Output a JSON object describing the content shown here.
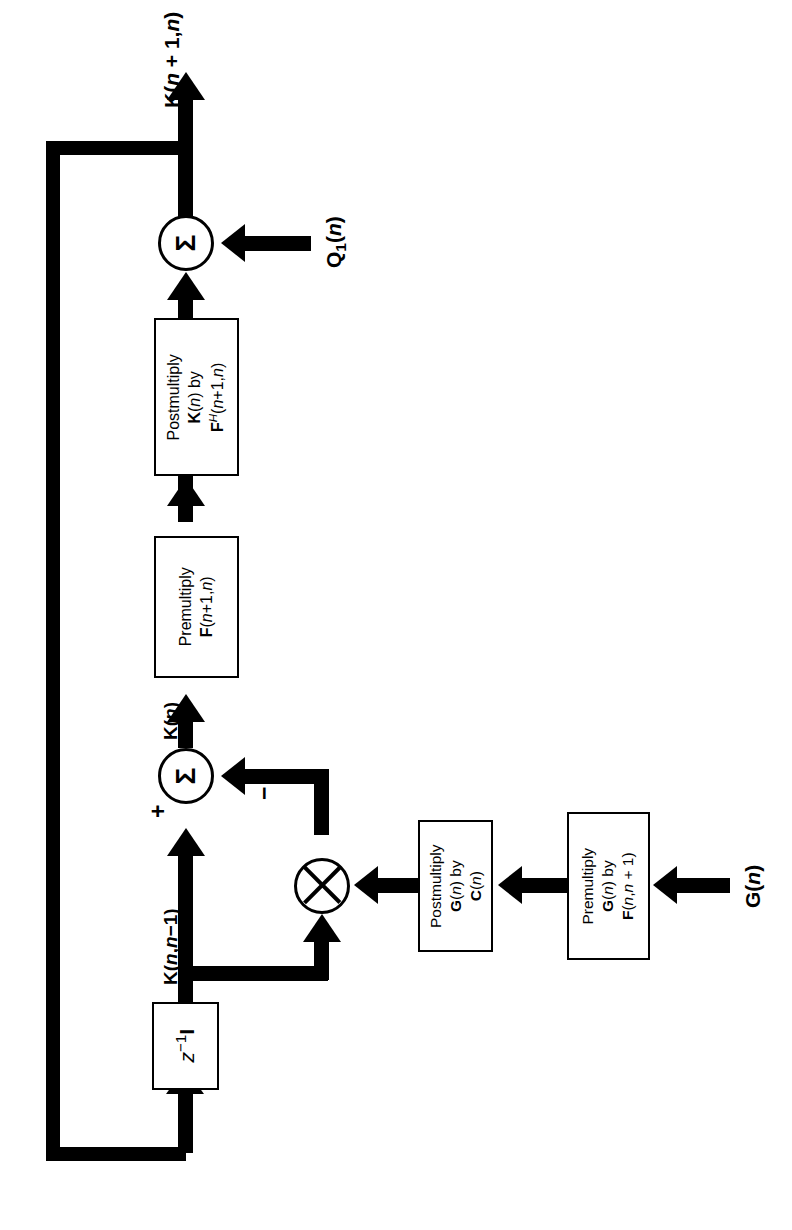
{
  "figure": {
    "kind": "signal-flow block diagram",
    "orientation": "rotated 90 degrees counter-clockwise on the page",
    "title": ""
  },
  "blocks": {
    "postmultiply_k": {
      "name": "postmultiply-k-block",
      "line1": "Postmultiply",
      "line2_html": "<b>K</b>(<i>n</i>) by",
      "line3_html": "<b>F</b><span class=\"sup\">H</span>(<i>n</i>+1,<i>n</i>)"
    },
    "premultiply_f": {
      "name": "premultiply-f-block",
      "line1": "Premultiply",
      "line2_html": "<b>F</b>(<i>n</i>+1,<i>n</i>)"
    },
    "postmultiply_g": {
      "name": "postmultiply-g-block",
      "line1": "Postmultiply",
      "line2_html": "<b>G</b>(<i>n</i>) by",
      "line3_html": "<b>C</b>(<i>n</i>)"
    },
    "premultiply_g": {
      "name": "premultiply-g-block",
      "line1": "Premultiply",
      "line2_html": "<b>G</b>(<i>n</i>) by",
      "line3_html": "<b>F</b>(<i>n</i>,<i>n</i> + 1)"
    },
    "delay": {
      "name": "unit-delay-block",
      "label_html": "<i>z</i><span class=\"sup\" style=\"font-style:normal\">−1</span><b>I</b>"
    }
  },
  "nodes": {
    "sum_top": {
      "name": "summing-junction-top",
      "glyph": "Σ"
    },
    "sum_mid": {
      "name": "summing-junction-middle",
      "glyph": "Σ"
    },
    "multiplier": {
      "name": "multiplier-node",
      "glyph": "⊗"
    }
  },
  "signals": {
    "output": {
      "name": "signal-label-output",
      "html": "<b>K</b>(<i>n</i> + 1,<i>n</i>)"
    },
    "q1": {
      "name": "signal-label-q1",
      "html": "<b>Q</b><span class=\"sub\">1</span>(<i>n</i>)"
    },
    "kn": {
      "name": "signal-label-kn",
      "html": "<b>K</b>(<i>n</i>)"
    },
    "knn1": {
      "name": "signal-label-knn1",
      "html": "<b>K</b>(<i>n</i>,<i>n</i>−1)"
    },
    "gn": {
      "name": "signal-label-gn",
      "html": "<b>G</b>(<i>n</i>)"
    },
    "plus": {
      "name": "sign-plus",
      "text": "+"
    },
    "minus": {
      "name": "sign-minus",
      "text": "−"
    }
  },
  "colors": {
    "ink": "#000000",
    "paper": "#ffffff"
  }
}
